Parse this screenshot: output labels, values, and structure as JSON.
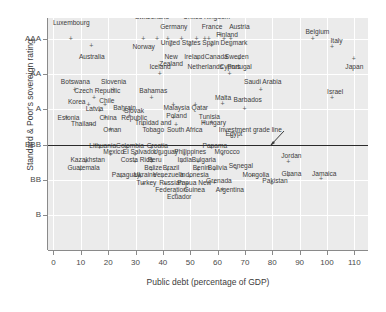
{
  "chart_data": {
    "type": "scatter",
    "title": "",
    "xlabel": "Public debt (percentage of GDP)",
    "ylabel": "Standard & Poor's sovereign rating",
    "xlim": [
      -2,
      115
    ],
    "ylim": [
      0,
      6.6
    ],
    "xticks": [
      0,
      10,
      20,
      30,
      40,
      50,
      60,
      70,
      80,
      90,
      100,
      110
    ],
    "xticklabels": [
      "0",
      "10",
      "20",
      "30",
      "40",
      "50",
      "60",
      "70",
      "80",
      "90",
      "100",
      "110"
    ],
    "yticks": [
      6.0,
      5.0,
      4.0,
      3.0,
      2.0,
      1.0
    ],
    "yticklabels": [
      "AAA",
      "AA",
      "A",
      "BBB",
      "BB",
      "B"
    ],
    "grid": true,
    "grid_color": "#ffffff",
    "plot_background": "#ebebeb",
    "marker": "+",
    "marker_color": "#5a5a5a",
    "annotations": [
      {
        "text": "Investment grade line",
        "x": 72,
        "y": 3.42,
        "arrow_to_x": 79,
        "arrow_to_y": 3.02
      }
    ],
    "reference_lines": [
      {
        "name": "investment-grade-line",
        "y": 3.0,
        "color": "#2b2b2b",
        "orientation": "horizontal"
      }
    ],
    "points": [
      {
        "label": "Luxembourg",
        "x": 6.5,
        "y": 6.0,
        "lx": 6.5,
        "ly": 6.45
      },
      {
        "label": "Australia",
        "x": 14.0,
        "y": 5.78,
        "lx": 14.0,
        "ly": 5.5
      },
      {
        "label": "Switzerland",
        "x": 38.0,
        "y": 6.0,
        "lx": 36.0,
        "ly": 6.62
      },
      {
        "label": "Germany",
        "x": 42.0,
        "y": 6.0,
        "lx": 44.0,
        "ly": 6.35
      },
      {
        "label": "Norway",
        "x": 33.0,
        "y": 6.0,
        "lx": 33.0,
        "ly": 5.78
      },
      {
        "label": "United Kingdom",
        "x": 52.5,
        "y": 6.0,
        "lx": 56.0,
        "ly": 6.62
      },
      {
        "label": "France",
        "x": 57.0,
        "y": 6.0,
        "lx": 58.0,
        "ly": 6.35
      },
      {
        "label": "Austria",
        "x": 65.0,
        "y": 6.0,
        "lx": 68.0,
        "ly": 6.35
      },
      {
        "label": "Finland",
        "x": 61.0,
        "y": 6.1,
        "lx": 63.5,
        "ly": 6.12
      },
      {
        "label": "United States",
        "x": 47.0,
        "y": 6.0,
        "lx": 46.5,
        "ly": 5.88
      },
      {
        "label": "Spain",
        "x": 55.5,
        "y": 6.0,
        "lx": 57.5,
        "ly": 5.88
      },
      {
        "label": "Denmark",
        "x": 62.5,
        "y": 6.0,
        "lx": 66.0,
        "ly": 5.88
      },
      {
        "label": "New\nZealand",
        "x": 43.0,
        "y": 5.78,
        "lx": 43.0,
        "ly": 5.5
      },
      {
        "label": "Ireland",
        "x": 50.0,
        "y": 5.78,
        "lx": 51.5,
        "ly": 5.5
      },
      {
        "label": "Canada",
        "x": 58.0,
        "y": 5.78,
        "lx": 59.5,
        "ly": 5.5
      },
      {
        "label": "Sweden",
        "x": 65.0,
        "y": 5.78,
        "lx": 67.0,
        "ly": 5.5
      },
      {
        "label": "Netherlands",
        "x": 53.0,
        "y": 5.42,
        "lx": 55.5,
        "ly": 5.22
      },
      {
        "label": "Portugal",
        "x": 68.0,
        "y": 5.42,
        "lx": 68.0,
        "ly": 5.22
      },
      {
        "label": "Belgium",
        "x": 95.0,
        "y": 6.0,
        "lx": 96.5,
        "ly": 6.2
      },
      {
        "label": "Italy",
        "x": 102.0,
        "y": 5.75,
        "lx": 103.5,
        "ly": 5.95
      },
      {
        "label": "Japan",
        "x": 110.0,
        "y": 5.42,
        "lx": 110.0,
        "ly": 5.2
      },
      {
        "label": "Iceland",
        "x": 39.0,
        "y": 5.0,
        "lx": 39.0,
        "ly": 5.22
      },
      {
        "label": "Cyprus",
        "x": 64.5,
        "y": 5.0,
        "lx": 64.5,
        "ly": 5.22
      },
      {
        "label": "Botswana",
        "x": 8.0,
        "y": 4.55,
        "lx": 8.0,
        "ly": 4.78
      },
      {
        "label": "Slovenia",
        "x": 22.0,
        "y": 4.55,
        "lx": 22.0,
        "ly": 4.78
      },
      {
        "label": "Czech Republic",
        "x": 15.0,
        "y": 4.3,
        "lx": 16.0,
        "ly": 4.52
      },
      {
        "label": "Bahamas",
        "x": 36.0,
        "y": 4.3,
        "lx": 36.5,
        "ly": 4.52
      },
      {
        "label": "Korea",
        "x": 13.0,
        "y": 4.1,
        "lx": 8.5,
        "ly": 4.22
      },
      {
        "label": "Chile",
        "x": 19.0,
        "y": 4.1,
        "lx": 19.5,
        "ly": 4.25
      },
      {
        "label": "Malaysia",
        "x": 44.0,
        "y": 4.1,
        "lx": 45.0,
        "ly": 4.05
      },
      {
        "label": "Qatar",
        "x": 52.0,
        "y": 4.1,
        "lx": 53.5,
        "ly": 4.05
      },
      {
        "label": "Saudi Arabia",
        "x": 76.0,
        "y": 4.55,
        "lx": 76.5,
        "ly": 4.78
      },
      {
        "label": "Israel",
        "x": 102.0,
        "y": 4.3,
        "lx": 103.0,
        "ly": 4.5
      },
      {
        "label": "Latvia",
        "x": 17.0,
        "y": 3.95,
        "lx": 15.0,
        "ly": 4.02
      },
      {
        "label": "Bahrain",
        "x": 26.0,
        "y": 3.95,
        "lx": 26.0,
        "ly": 4.05
      },
      {
        "label": "Malta",
        "x": 62.0,
        "y": 4.15,
        "lx": 62.0,
        "ly": 4.32
      },
      {
        "label": "Barbados",
        "x": 70.0,
        "y": 4.0,
        "lx": 71.0,
        "ly": 4.28
      },
      {
        "label": "Estonia",
        "x": 5.0,
        "y": 3.75,
        "lx": 5.5,
        "ly": 3.76
      },
      {
        "label": "China",
        "x": 19.0,
        "y": 3.75,
        "lx": 20.0,
        "ly": 3.76
      },
      {
        "label": "Slovak\nRepublic",
        "x": 28.0,
        "y": 3.8,
        "lx": 29.5,
        "ly": 3.95
      },
      {
        "label": "Poland",
        "x": 44.0,
        "y": 3.75,
        "lx": 45.0,
        "ly": 3.82
      },
      {
        "label": "Thailand",
        "x": 14.0,
        "y": 3.55,
        "lx": 11.0,
        "ly": 3.58
      },
      {
        "label": "Oman",
        "x": 21.0,
        "y": 3.4,
        "lx": 21.5,
        "ly": 3.42
      },
      {
        "label": "Trinidad and\nTobago",
        "x": 33.0,
        "y": 3.55,
        "lx": 36.5,
        "ly": 3.62
      },
      {
        "label": "South Africa",
        "x": 45.0,
        "y": 3.55,
        "lx": 48.0,
        "ly": 3.42
      },
      {
        "label": "Tunisia",
        "x": 55.0,
        "y": 3.6,
        "lx": 57.0,
        "ly": 3.78
      },
      {
        "label": "Hungary",
        "x": 58.0,
        "y": 3.6,
        "lx": 58.5,
        "ly": 3.6
      },
      {
        "label": "Egypt",
        "x": 65.0,
        "y": 3.22,
        "lx": 66.0,
        "ly": 3.3
      },
      {
        "label": "Lithuania",
        "x": 17.0,
        "y": 2.9,
        "lx": 18.0,
        "ly": 2.96
      },
      {
        "label": "Colombia",
        "x": 27.0,
        "y": 2.9,
        "lx": 28.0,
        "ly": 2.96
      },
      {
        "label": "Croatia",
        "x": 36.0,
        "y": 2.9,
        "lx": 38.0,
        "ly": 2.96
      },
      {
        "label": "Panama",
        "x": 58.0,
        "y": 2.9,
        "lx": 59.0,
        "ly": 2.96
      },
      {
        "label": "Mexico",
        "x": 21.0,
        "y": 2.7,
        "lx": 22.0,
        "ly": 2.78
      },
      {
        "label": "El Salvador",
        "x": 30.0,
        "y": 2.7,
        "lx": 31.5,
        "ly": 2.78
      },
      {
        "label": "Uruguay",
        "x": 39.0,
        "y": 2.7,
        "lx": 41.0,
        "ly": 2.78
      },
      {
        "label": "Philippines",
        "x": 48.0,
        "y": 2.7,
        "lx": 50.0,
        "ly": 2.78
      },
      {
        "label": "Morocco",
        "x": 62.0,
        "y": 2.7,
        "lx": 63.5,
        "ly": 2.78
      },
      {
        "label": "Kazakhstan",
        "x": 12.0,
        "y": 2.5,
        "lx": 12.5,
        "ly": 2.56
      },
      {
        "label": "Costa Rica",
        "x": 30.0,
        "y": 2.5,
        "lx": 30.5,
        "ly": 2.56
      },
      {
        "label": "Peru",
        "x": 36.0,
        "y": 2.5,
        "lx": 37.0,
        "ly": 2.56
      },
      {
        "label": "India",
        "x": 47.0,
        "y": 2.5,
        "lx": 48.0,
        "ly": 2.56
      },
      {
        "label": "Bulgaria",
        "x": 53.0,
        "y": 2.5,
        "lx": 55.0,
        "ly": 2.56
      },
      {
        "label": "Jordan",
        "x": 86.0,
        "y": 2.5,
        "lx": 87.0,
        "ly": 2.66
      },
      {
        "label": "Guatemala",
        "x": 10.0,
        "y": 2.25,
        "lx": 11.0,
        "ly": 2.32
      },
      {
        "label": "Belize",
        "x": 36.0,
        "y": 2.25,
        "lx": 36.5,
        "ly": 2.32
      },
      {
        "label": "Brazil",
        "x": 42.0,
        "y": 2.25,
        "lx": 43.0,
        "ly": 2.32
      },
      {
        "label": "Benin",
        "x": 53.0,
        "y": 2.25,
        "lx": 54.0,
        "ly": 2.32
      },
      {
        "label": "Bolivia",
        "x": 59.0,
        "y": 2.25,
        "lx": 60.0,
        "ly": 2.32
      },
      {
        "label": "Senegal",
        "x": 67.0,
        "y": 2.3,
        "lx": 68.5,
        "ly": 2.38
      },
      {
        "label": "Ghana",
        "x": 86.0,
        "y": 2.1,
        "lx": 87.0,
        "ly": 2.16
      },
      {
        "label": "Jamaica",
        "x": 98.0,
        "y": 2.0,
        "lx": 99.0,
        "ly": 2.16
      },
      {
        "label": "Paraguay",
        "x": 25.0,
        "y": 2.05,
        "lx": 26.5,
        "ly": 2.12
      },
      {
        "label": "Ukraine",
        "x": 32.0,
        "y": 2.05,
        "lx": 33.5,
        "ly": 2.12
      },
      {
        "label": "Venezuela",
        "x": 40.0,
        "y": 2.05,
        "lx": 42.0,
        "ly": 2.12
      },
      {
        "label": "Indonesia",
        "x": 50.0,
        "y": 2.05,
        "lx": 51.5,
        "ly": 2.12
      },
      {
        "label": "Mongolia",
        "x": 73.0,
        "y": 2.1,
        "lx": 74.0,
        "ly": 2.12
      },
      {
        "label": "Turkey",
        "x": 33.0,
        "y": 1.85,
        "lx": 34.0,
        "ly": 1.9
      },
      {
        "label": "Russian\nFederation",
        "x": 41.0,
        "y": 1.85,
        "lx": 43.0,
        "ly": 1.9
      },
      {
        "label": "Papua New\nGuinea",
        "x": 49.0,
        "y": 1.85,
        "lx": 51.5,
        "ly": 1.9
      },
      {
        "label": "Grenada",
        "x": 59.0,
        "y": 1.9,
        "lx": 60.5,
        "ly": 1.95
      },
      {
        "label": "Pakistan",
        "x": 80.0,
        "y": 1.85,
        "lx": 81.0,
        "ly": 1.95
      },
      {
        "label": "Argentina",
        "x": 62.0,
        "y": 1.7,
        "lx": 64.5,
        "ly": 1.72
      },
      {
        "label": "Ecuador",
        "x": 45.0,
        "y": 1.55,
        "lx": 46.0,
        "ly": 1.52
      }
    ]
  }
}
